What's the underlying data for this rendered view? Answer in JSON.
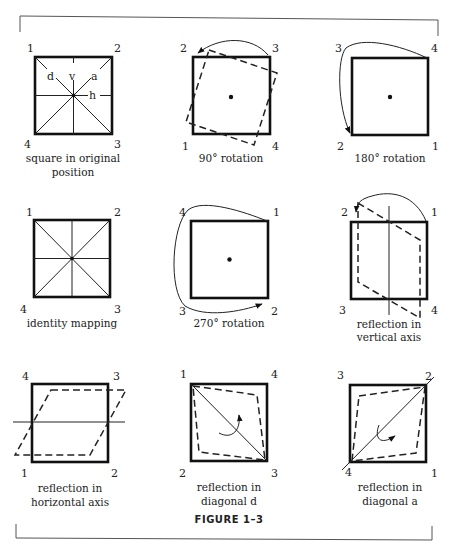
{
  "figure": {
    "title": "FIGURE 1–3",
    "panels": [
      {
        "id": "original",
        "caption": [
          "square in original",
          "position"
        ],
        "corners": {
          "tl": "1",
          "tr": "2",
          "bl": "4",
          "br": "3"
        },
        "axis_labels": {
          "d": "d",
          "v": "v",
          "a": "a",
          "h": "h"
        }
      },
      {
        "id": "rot90",
        "caption": [
          "90° rotation"
        ],
        "corners": {
          "tl": "2",
          "tr": "3",
          "bl": "1",
          "br": "4"
        }
      },
      {
        "id": "rot180",
        "caption": [
          "180° rotation"
        ],
        "corners": {
          "tl": "3",
          "tr": "4",
          "bl": "2",
          "br": "1"
        }
      },
      {
        "id": "identity",
        "caption": [
          "identity mapping"
        ],
        "corners": {
          "tl": "1",
          "tr": "2",
          "bl": "4",
          "br": "3"
        }
      },
      {
        "id": "rot270",
        "caption": [
          "270° rotation"
        ],
        "corners": {
          "tl": "4",
          "tr": "1",
          "bl": "3",
          "br": "2"
        }
      },
      {
        "id": "refl-vertical",
        "caption": [
          "reflection in",
          "vertical axis"
        ],
        "corners": {
          "tl": "2",
          "tr": "1",
          "bl": "3",
          "br": "4"
        }
      },
      {
        "id": "refl-horizontal",
        "caption": [
          "reflection in",
          "horizontal axis"
        ],
        "corners": {
          "tl": "4",
          "tr": "3",
          "bl": "1",
          "br": "2"
        }
      },
      {
        "id": "refl-diag-d",
        "caption": [
          "reflection in",
          "diagonal d"
        ],
        "corners": {
          "tl": "1",
          "tr": "4",
          "bl": "2",
          "br": "3"
        }
      },
      {
        "id": "refl-diag-a",
        "caption": [
          "reflection in",
          "diagonal a"
        ],
        "corners": {
          "tl": "3",
          "tr": "2",
          "bl": "4",
          "br": "1"
        }
      }
    ]
  }
}
